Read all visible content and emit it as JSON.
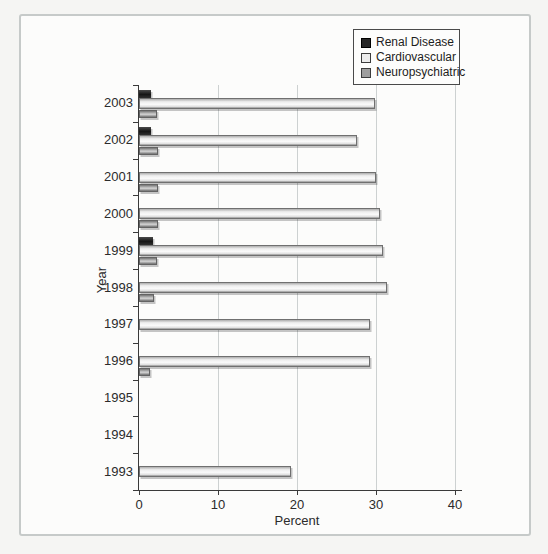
{
  "legend": {
    "items": [
      {
        "label": "Renal Disease",
        "color": "#262626"
      },
      {
        "label": "Cardiovascular",
        "color": "#ececec"
      },
      {
        "label": "Neuropsychiatric",
        "color": "#9e9e9e"
      }
    ]
  },
  "colors": {
    "axis": "#3a3a3a",
    "grid": "#cdd1d1",
    "frame_border": "#c6cac9",
    "background": "#fcfcfb",
    "renal_bar": "#262626",
    "cardiovascular_bar": "#ededed",
    "neuropsychiatric_bar": "#a8a8a8"
  },
  "chart_data": {
    "type": "bar",
    "orientation": "horizontal",
    "title": "",
    "xlabel": "Percent",
    "ylabel": "Year",
    "xlim": [
      0,
      40
    ],
    "xticks": [
      0,
      10,
      20,
      30,
      40
    ],
    "grid": true,
    "legend_position": "top-right",
    "categories": [
      "2003",
      "2002",
      "2001",
      "2000",
      "1999",
      "1998",
      "1997",
      "1996",
      "1995",
      "1994",
      "1993"
    ],
    "series": [
      {
        "name": "Renal Disease",
        "color": "#262626",
        "values": [
          1.5,
          1.5,
          0,
          0,
          1.8,
          0,
          0,
          0,
          0,
          0,
          0
        ]
      },
      {
        "name": "Cardiovascular",
        "color": "#ededed",
        "values": [
          29.6,
          27.4,
          29.8,
          30.3,
          30.6,
          31.1,
          29.0,
          29.0,
          0,
          0,
          19.0
        ]
      },
      {
        "name": "Neuropsychiatric",
        "color": "#a8a8a8",
        "values": [
          2.0,
          2.1,
          2.1,
          2.1,
          2.0,
          1.7,
          0,
          1.2,
          0,
          0,
          0
        ]
      }
    ]
  }
}
